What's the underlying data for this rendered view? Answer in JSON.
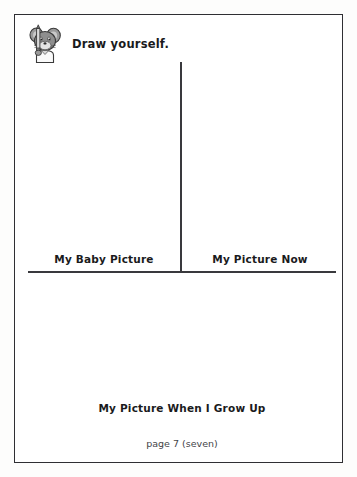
{
  "page": {
    "instruction": "Draw yourself.",
    "page_number_label": "page 7 (seven)",
    "mascot_icon": "mouse-with-pencil-icon",
    "ink_color": "#1a1a1c",
    "rule_color": "#39393d",
    "border_color": "#2f2f33",
    "paper_color": "#ffffff"
  },
  "drawing_boxes": [
    {
      "caption": "My Baby Picture"
    },
    {
      "caption": "My Picture Now"
    },
    {
      "caption": "My Picture When I Grow Up"
    }
  ]
}
